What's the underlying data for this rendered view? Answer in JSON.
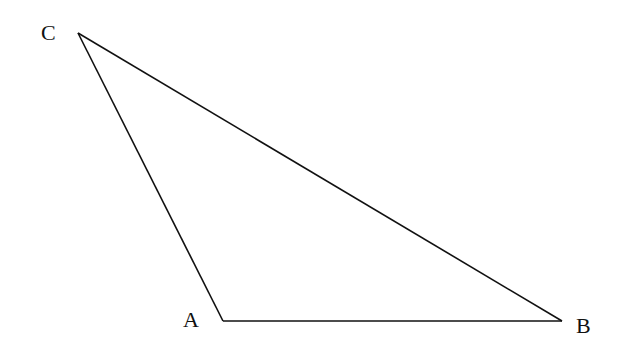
{
  "diagram": {
    "type": "triangle",
    "stroke_color": "#111111",
    "background": "#ffffff",
    "vertices": [
      {
        "name": "A",
        "x": 223,
        "y": 321,
        "label_x": 183,
        "label_y": 327
      },
      {
        "name": "B",
        "x": 562,
        "y": 321,
        "label_x": 576,
        "label_y": 333
      },
      {
        "name": "C",
        "x": 78,
        "y": 33,
        "label_x": 41,
        "label_y": 40
      }
    ],
    "edges": [
      {
        "name": "AB",
        "from": "A",
        "to": "B"
      },
      {
        "name": "BC",
        "from": "B",
        "to": "C"
      },
      {
        "name": "CA",
        "from": "C",
        "to": "A"
      }
    ],
    "labels": {
      "A": "A",
      "B": "B",
      "C": "C"
    }
  }
}
